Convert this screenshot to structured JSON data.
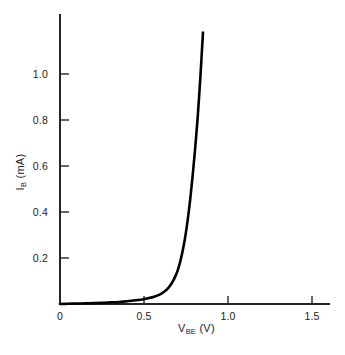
{
  "chart_data": {
    "type": "line",
    "title": "",
    "xlabel": "V_BE (V)",
    "xlabel_main": "V",
    "xlabel_sub": "BE",
    "xlabel_unit": "(V)",
    "ylabel": "I_B (mA)",
    "ylabel_main": "I",
    "ylabel_sub": "B",
    "ylabel_unit": "(mA)",
    "xlim": [
      0,
      1.6
    ],
    "ylim": [
      0,
      1.22
    ],
    "xticks": [
      0,
      0.5,
      1.0,
      1.5
    ],
    "xtick_labels": [
      "0",
      "0.5",
      "1.0",
      "1.5"
    ],
    "yticks": [
      0.2,
      0.4,
      0.6,
      0.8,
      1.0
    ],
    "ytick_labels": [
      "0.2",
      "0.4",
      "0.6",
      "0.8",
      "1.0"
    ],
    "grid": false,
    "legend": null,
    "line_color": "#000000",
    "line_width_px": 2.6,
    "axis_color": "#262626",
    "series": [
      {
        "name": "base current",
        "x": [
          0.0,
          0.05,
          0.1,
          0.15,
          0.2,
          0.25,
          0.3,
          0.35,
          0.4,
          0.45,
          0.5,
          0.53,
          0.56,
          0.59,
          0.62,
          0.645,
          0.665,
          0.685,
          0.7,
          0.715,
          0.73,
          0.745,
          0.76,
          0.775,
          0.79,
          0.805,
          0.82,
          0.835,
          0.851
        ],
        "y": [
          0.0,
          0.001,
          0.002,
          0.003,
          0.004,
          0.005,
          0.007,
          0.009,
          0.012,
          0.016,
          0.021,
          0.026,
          0.032,
          0.04,
          0.053,
          0.07,
          0.09,
          0.118,
          0.145,
          0.182,
          0.23,
          0.29,
          0.365,
          0.455,
          0.56,
          0.68,
          0.815,
          0.98,
          1.18
        ]
      }
    ],
    "annotations": []
  },
  "figure": {
    "background": "#ffffff",
    "geometry": {
      "origin_x_px": 60,
      "origin_y_px": 304,
      "x_px_per_unit": 168,
      "y_px_per_unit": 230,
      "x_axis_end_px": 330,
      "y_axis_top_px": 14
    }
  }
}
